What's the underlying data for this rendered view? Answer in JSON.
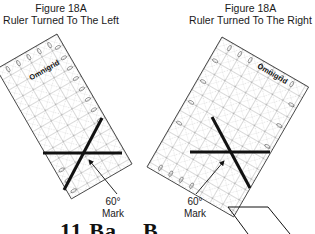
{
  "figures": {
    "left": {
      "title_line1": "Figure 18A",
      "title_line2": "Ruler Turned To The Left",
      "ruler_brand": "Omnigrid",
      "mark_line1": "60°",
      "mark_line2": "Mark"
    },
    "right": {
      "title_line1": "Figure 18A",
      "title_line2": "Ruler Turned To The Right",
      "ruler_brand": "Omnigrid",
      "mark_line1": "60°",
      "mark_line2": "Mark"
    }
  },
  "bottom": {
    "partial_heading": "11 Ba...  B..."
  },
  "colors": {
    "line": "#111111",
    "grid": "#555555",
    "background": "#ffffff"
  }
}
